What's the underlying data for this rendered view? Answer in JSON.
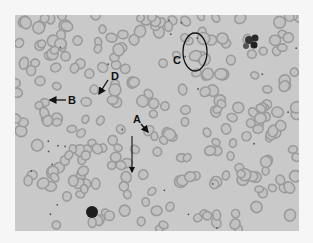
{
  "figure": {
    "type": "blood smear micrograph",
    "background_color": "#c9c9c9",
    "cell_ring_color": "#9b9b9b",
    "cell_center_color": "#c2c2c2",
    "annotation_color": "#111111"
  },
  "labels": {
    "A": "A",
    "B": "B",
    "C": "C",
    "D": "D"
  }
}
